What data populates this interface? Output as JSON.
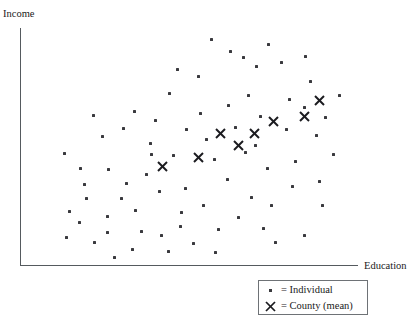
{
  "chart_data": {
    "type": "scatter",
    "title": "",
    "xlabel": "Education",
    "ylabel": "Income",
    "grid": false,
    "axis_ticks": false,
    "xlim": [
      0,
      100
    ],
    "ylim": [
      0,
      100
    ],
    "legend_position": "bottom-right",
    "series": [
      {
        "name": "Individual",
        "marker": "small-square-dot",
        "color": "#3a3a3e",
        "points": [
          [
            24.3,
            54.5
          ],
          [
            13.0,
            47.3
          ],
          [
            17.8,
            40.7
          ],
          [
            26.1,
            40.3
          ],
          [
            19.6,
            27.9
          ],
          [
            29.9,
            27.9
          ],
          [
            17.5,
            17.8
          ],
          [
            25.9,
            20.3
          ],
          [
            25.9,
            13.5
          ],
          [
            28.0,
            2.6
          ],
          [
            37.5,
            38.2
          ],
          [
            34.1,
            22.9
          ],
          [
            33.4,
            6.1
          ],
          [
            38.6,
            51.4
          ],
          [
            40.0,
            61.3
          ],
          [
            44.4,
            72.9
          ],
          [
            45.4,
            46.2
          ],
          [
            49.1,
            32.2
          ],
          [
            48.0,
            22.0
          ],
          [
            42.0,
            12.3
          ],
          [
            47.7,
            16.1
          ],
          [
            53.0,
            80.1
          ],
          [
            53.6,
            64.3
          ],
          [
            55.5,
            53.1
          ],
          [
            57.9,
            44.7
          ],
          [
            54.4,
            25.0
          ],
          [
            58.9,
            14.8
          ],
          [
            62.0,
            67.8
          ],
          [
            63.9,
            58.3
          ],
          [
            61.6,
            36.0
          ],
          [
            67.8,
            72.1
          ],
          [
            66.4,
            88.3
          ],
          [
            70.2,
            84.4
          ],
          [
            71.5,
            63.0
          ],
          [
            70.0,
            50.5
          ],
          [
            73.6,
            40.9
          ],
          [
            68.9,
            28.5
          ],
          [
            74.8,
            24.8
          ],
          [
            77.8,
            86.0
          ],
          [
            80.1,
            70.1
          ],
          [
            79.2,
            57.6
          ],
          [
            82.0,
            43.6
          ],
          [
            85.0,
            88.5
          ],
          [
            86.3,
            77.9
          ],
          [
            84.5,
            66.8
          ],
          [
            88.2,
            54.8
          ],
          [
            91.0,
            62.6
          ],
          [
            89.0,
            35.4
          ],
          [
            93.2,
            47.0
          ],
          [
            62.5,
            91.0
          ],
          [
            46.8,
            83.0
          ],
          [
            33.8,
            65.0
          ],
          [
            51.5,
            8.9
          ],
          [
            58.0,
            5.0
          ],
          [
            76.0,
            9.2
          ],
          [
            84.6,
            12.0
          ],
          [
            90.0,
            25.2
          ],
          [
            21.5,
            63.6
          ],
          [
            30.5,
            58.0
          ],
          [
            41.2,
            31.0
          ],
          [
            36.0,
            14.0
          ],
          [
            65.0,
            20.0
          ],
          [
            72.5,
            15.0
          ],
          [
            22.0,
            9.0
          ],
          [
            14.5,
            22.5
          ],
          [
            13.5,
            11.5
          ],
          [
            44.0,
            5.5
          ],
          [
            95.0,
            72.0
          ],
          [
            57.0,
            96.0
          ],
          [
            74.0,
            94.0
          ],
          [
            81.0,
            33.0
          ],
          [
            67.0,
            47.5
          ],
          [
            49.5,
            57.5
          ],
          [
            39.0,
            47.0
          ],
          [
            31.5,
            34.5
          ],
          [
            19.0,
            34.0
          ]
        ]
      },
      {
        "name": "County (mean)",
        "marker": "x-cross",
        "color": "#1b1b1f",
        "points": [
          [
            42.3,
            41.8
          ],
          [
            52.9,
            45.6
          ],
          [
            59.7,
            55.6
          ],
          [
            65.0,
            50.6
          ],
          [
            69.8,
            55.6
          ],
          [
            75.4,
            61.1
          ],
          [
            84.6,
            63.0
          ],
          [
            89.1,
            69.8
          ]
        ]
      }
    ]
  },
  "legend": {
    "items": [
      {
        "marker": "dot",
        "label": "= Individual"
      },
      {
        "marker": "x",
        "label": "= County (mean)"
      }
    ]
  }
}
